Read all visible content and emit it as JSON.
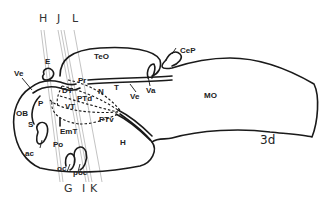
{
  "figure": {
    "panel_label": "3d",
    "section_lines": {
      "top": [
        "H",
        "J",
        "L"
      ],
      "bottom": [
        "G",
        "I",
        "K"
      ]
    },
    "regions": {
      "TeO": "TeO",
      "CeP": "CeP",
      "MO": "MO",
      "E": "E",
      "Ve_left": "Ve",
      "Ve_mid": "Ve",
      "Va": "Va",
      "T": "T",
      "Pr": "Pr",
      "DT": "DT",
      "N": "N",
      "PTd": "PTd",
      "VT": "VT",
      "P": "P",
      "OB": "OB",
      "S": "S",
      "ac": "ac",
      "EmT": "EmT",
      "PTv": "PTv",
      "Po": "Po",
      "H": "H",
      "oc": "oc",
      "poc": "poc"
    },
    "colors": {
      "outline": "#1a1a1a",
      "section_line": "#9a9a9a",
      "text": "#222222"
    }
  }
}
